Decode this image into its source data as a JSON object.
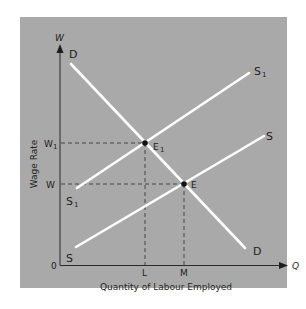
{
  "colors": {
    "background": "#ffffff",
    "panel": "#a9a9a9",
    "curve": "#ffffff",
    "axis": "#2a2a2a",
    "text": "#1e1e1e",
    "guide": "#3a3a3a"
  },
  "axes": {
    "y_symbol": "W",
    "x_symbol": "Q",
    "y_label": "Wage Rate",
    "x_label": "Quantity of Labour Employed",
    "origin": "0"
  },
  "y_ticks": [
    {
      "label": "W",
      "sub": "1",
      "name": "W1"
    },
    {
      "label": "W",
      "sub": "",
      "name": "W"
    }
  ],
  "x_ticks": [
    {
      "label": "L"
    },
    {
      "label": "M"
    }
  ],
  "curves": {
    "demand": {
      "start_label": "D",
      "end_label": "D"
    },
    "supply_new": {
      "start_label": "S",
      "start_sub": "1",
      "end_label": "S",
      "end_sub": "1"
    },
    "supply_old": {
      "start_label": "S",
      "end_label": "S"
    }
  },
  "equilibria": [
    {
      "label": "E",
      "sub": "1",
      "wage": "W1",
      "quantity": "L"
    },
    {
      "label": "E",
      "sub": "",
      "wage": "W",
      "quantity": "M"
    }
  ]
}
